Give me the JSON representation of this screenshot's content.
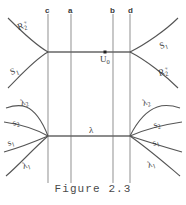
{
  "figure": {
    "caption": "Figure 2.3",
    "vertical_lines": [
      {
        "id": "c",
        "label": "c",
        "x": 48
      },
      {
        "id": "a",
        "label": "a",
        "x": 71
      },
      {
        "id": "b",
        "label": "b",
        "x": 113
      },
      {
        "id": "d",
        "label": "d",
        "x": 130
      }
    ],
    "nodes": [
      {
        "id": "u0",
        "label": "U",
        "sub": "0",
        "x": 105,
        "y": 52
      }
    ],
    "curve_labels": {
      "upper_left_outer": {
        "base": "R",
        "sub": "2",
        "sup": "+"
      },
      "upper_left_inner": {
        "base": "S",
        "sub": "1",
        "sup": ""
      },
      "upper_right_outer": {
        "base": "S",
        "sub": "1",
        "sup": ""
      },
      "upper_right_inner": {
        "base": "R",
        "sub": "2",
        "sup": "+"
      },
      "lower_left_lambda2": {
        "base": "λ",
        "sub": "2",
        "sup": ""
      },
      "lower_left_s2": {
        "base": "s",
        "sub": "2",
        "sup": ""
      },
      "lower_left_s1": {
        "base": "s",
        "sub": "1",
        "sup": ""
      },
      "lower_left_lambda1": {
        "base": "λ",
        "sub": "1",
        "sup": ""
      },
      "lower_right_lambda2": {
        "base": "λ",
        "sub": "2",
        "sup": ""
      },
      "lower_right_s2": {
        "base": "s",
        "sub": "2",
        "sup": ""
      },
      "lower_right_s1": {
        "base": "s",
        "sub": "1",
        "sup": ""
      },
      "lower_right_lambda1": {
        "base": "λ",
        "sub": "1",
        "sup": ""
      },
      "center_lambda": {
        "base": "λ",
        "sub": "",
        "sup": ""
      }
    },
    "colors": {
      "background": "#ffffff",
      "vertical_line": "#9a9a9a",
      "horizontal_line": "#666666",
      "curve": "#555555",
      "text": "#3a3a3a"
    }
  }
}
